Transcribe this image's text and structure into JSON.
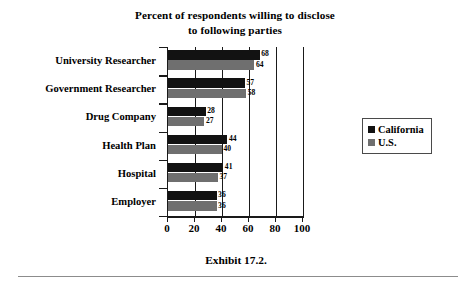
{
  "chart_data": {
    "type": "bar",
    "orientation": "horizontal",
    "title": "Percent of respondents willing to disclose to following parties",
    "title_lines": [
      "Percent of respondents willing to disclose",
      "to following parties"
    ],
    "caption": "Exhibit 17.2.",
    "xlabel": "",
    "ylabel": "",
    "xlim": [
      0,
      100
    ],
    "xticks": [
      0,
      20,
      40,
      60,
      80,
      100
    ],
    "xticklabels": [
      "0",
      "20",
      "40",
      "60",
      "80",
      "100"
    ],
    "grid": true,
    "grid_axis": "x",
    "legend_position": "right",
    "categories": [
      "University Researcher",
      "Government Researcher",
      "Drug Company",
      "Health Plan",
      "Hospital",
      "Employer"
    ],
    "series": [
      {
        "name": "California",
        "color": "#121212",
        "values": [
          68,
          57,
          28,
          44,
          41,
          36
        ],
        "labels": [
          "68",
          "57",
          "28",
          "44",
          "41",
          "36"
        ]
      },
      {
        "name": "U.S.",
        "color": "#6f6f6f",
        "values": [
          64,
          58,
          27,
          40,
          37,
          36
        ],
        "labels": [
          "64",
          "58",
          "27",
          "40",
          "37",
          "36"
        ]
      }
    ]
  },
  "legend": {
    "items": [
      {
        "label": "California",
        "color": "#121212"
      },
      {
        "label": "U.S.",
        "color": "#6f6f6f"
      }
    ]
  },
  "colors": {
    "axis": "#1a1a1a",
    "background": "#ffffff",
    "series_california": "#121212",
    "series_us": "#6f6f6f",
    "rule": "#8c8c8c"
  }
}
